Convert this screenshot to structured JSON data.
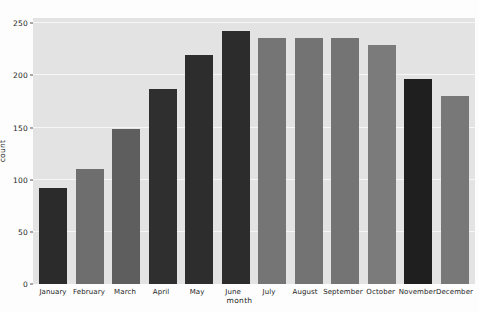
{
  "chart_data": {
    "type": "bar",
    "title": "",
    "subtitle": "",
    "xlabel": "month",
    "ylabel": "count",
    "categories": [
      "January",
      "February",
      "March",
      "April",
      "May",
      "June",
      "July",
      "August",
      "September",
      "October",
      "November",
      "December"
    ],
    "values": [
      92,
      110,
      149,
      187,
      220,
      243,
      236,
      236,
      236,
      229,
      197,
      180
    ],
    "ylim": [
      0,
      255
    ],
    "yticks": [
      0,
      50,
      100,
      150,
      200,
      250
    ],
    "ytick_labels": [
      "0",
      "50",
      "100",
      "150",
      "200",
      "250"
    ],
    "grid": true,
    "grid_axis": "y",
    "legend": false,
    "bar_colors": [
      "#2b2b2b",
      "#6e6e6e",
      "#5e5e5e",
      "#2f2f2f",
      "#2d2d2d",
      "#2c2c2c",
      "#757575",
      "#737373",
      "#747474",
      "#7b7b7b",
      "#1f1f1f",
      "#787878"
    ],
    "panel_background": "#e3e3e3",
    "gridline_color": "#f6f6f6",
    "figure_background": "#fdfdfd"
  }
}
